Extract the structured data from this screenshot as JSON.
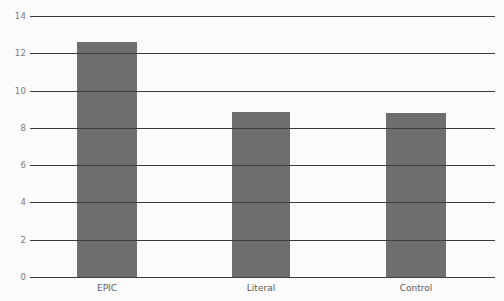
{
  "chart_data": {
    "type": "bar",
    "title": "",
    "subtitle": "",
    "xlabel": "",
    "ylabel": "",
    "categories": [
      "EPIC",
      "Literal",
      "Control"
    ],
    "values": [
      12.6,
      8.85,
      8.8
    ],
    "series": [
      {
        "name": "",
        "values": [
          12.6,
          8.85,
          8.8
        ]
      }
    ],
    "ylim": [
      0,
      14
    ],
    "yticks": [
      0,
      2,
      4,
      6,
      8,
      10,
      12,
      14
    ],
    "ytick_labels": [
      "0",
      "2",
      "4",
      "6",
      "8",
      "10",
      "12",
      "14"
    ],
    "xtick_labels": [
      "EPIC",
      "Literal",
      "Control"
    ],
    "grid": true,
    "grid_axis": "y",
    "legend": false,
    "legend_position": "none",
    "bar_color": "#6e6e6e",
    "grid_color": "#3c3c3c",
    "axis_color": "#3c3c3c",
    "background_color": "#fbfbfb",
    "tick_label_color": "#7a7a7a",
    "category_label_color": "#5a5a5a",
    "annotations": []
  }
}
